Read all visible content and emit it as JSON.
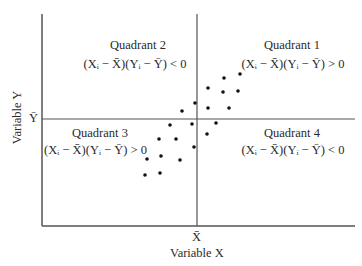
{
  "chart_data": {
    "type": "scatter",
    "title": "",
    "xlabel": "Variable X",
    "ylabel": "Variable Y",
    "x_mean_label": "X̄",
    "y_mean_label": "Ȳ",
    "grid": false,
    "quadrants": [
      {
        "name": "Quadrant 1",
        "formula": "(Xᵢ − X̄)(Yᵢ − Ȳ) > 0",
        "position": "upper-right"
      },
      {
        "name": "Quadrant 2",
        "formula": "(Xᵢ − X̄)(Yᵢ − Ȳ) < 0",
        "position": "upper-left"
      },
      {
        "name": "Quadrant 3",
        "formula": "(Xᵢ − X̄)(Yᵢ − Ȳ) > 0",
        "position": "lower-left"
      },
      {
        "name": "Quadrant 4",
        "formula": "(Xᵢ − X̄)(Yᵢ − Ȳ) < 0",
        "position": "lower-right"
      }
    ],
    "points_px": [
      [
        224,
        78
      ],
      [
        240,
        74
      ],
      [
        208,
        88
      ],
      [
        223,
        92
      ],
      [
        238,
        91
      ],
      [
        195,
        103
      ],
      [
        208,
        108
      ],
      [
        229,
        108
      ],
      [
        182,
        111
      ],
      [
        170,
        125
      ],
      [
        192,
        124
      ],
      [
        216,
        123
      ],
      [
        207,
        134
      ],
      [
        159,
        139
      ],
      [
        176,
        139
      ],
      [
        194,
        147
      ],
      [
        147,
        159
      ],
      [
        161,
        156
      ],
      [
        180,
        160
      ],
      [
        145,
        175
      ],
      [
        160,
        173
      ]
    ],
    "axes_px": {
      "left": 42,
      "top": 14,
      "bottom": 226,
      "right": 355,
      "x_mean": 197,
      "y_mean": 119
    }
  },
  "labels": {
    "q1_title": "Quadrant 1",
    "q1_formula": "(Xᵢ − X̄)(Yᵢ − Ȳ) > 0",
    "q2_title": "Quadrant 2",
    "q2_formula": "(Xᵢ − X̄)(Yᵢ − Ȳ) < 0",
    "q3_title": "Quadrant 3",
    "q3_formula": "(Xᵢ − X̄)(Yᵢ − Ȳ) > 0",
    "q4_title": "Quadrant 4",
    "q4_formula": "(Xᵢ − X̄)(Yᵢ − Ȳ) < 0",
    "x_mean": "X̄",
    "y_mean": "Ȳ",
    "x_axis": "Variable X",
    "y_axis": "Variable Y"
  }
}
